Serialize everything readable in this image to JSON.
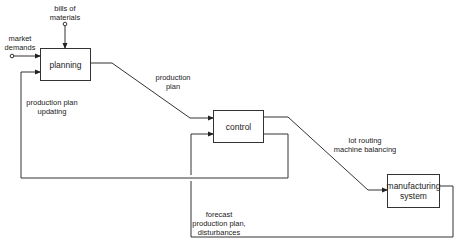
{
  "diagram": {
    "type": "block-flow",
    "nodes": [
      {
        "id": "planning",
        "label": "planning"
      },
      {
        "id": "control",
        "label": "control"
      },
      {
        "id": "manufacturing",
        "label": "manufacturing system"
      }
    ],
    "inputs": {
      "market_demands": "market demands",
      "bills_of_materials": "bills of materials"
    },
    "edge_labels": {
      "production_plan": "production plan",
      "lot_routing": "lot routing machine balancing",
      "plan_updating": "production plan updating",
      "forecast": "forecast production plan, disturbances"
    }
  },
  "labels": {
    "bills_line1": "bills of",
    "bills_line2": "materials",
    "market_line1": "market",
    "market_line2": "demands",
    "prodplan_line1": "production",
    "prodplan_line2": "plan",
    "updating_line1": "production plan",
    "updating_line2": "updating",
    "lot_line1": "lot routing",
    "lot_line2": "machine balancing",
    "forecast_line1": "forecast",
    "forecast_line2": "production plan,",
    "forecast_line3": "disturbances",
    "mfg_line1": "manufacturing",
    "mfg_line2": "system",
    "planning": "planning",
    "control": "control"
  },
  "colors": {
    "line": "#333333",
    "background": "#ffffff"
  }
}
